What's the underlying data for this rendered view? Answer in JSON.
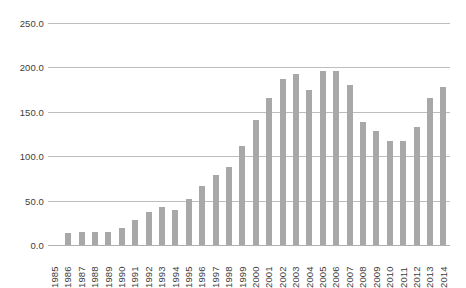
{
  "chart_data": {
    "type": "bar",
    "title": "",
    "subtitle": "",
    "xlabel": "",
    "ylabel": "",
    "ylim": [
      0,
      250
    ],
    "ytick_values": [
      250.0,
      200.0,
      150.0,
      100.0,
      50.0,
      0.0
    ],
    "ytick_labels": [
      "250.0",
      "200.0",
      "150.0",
      "100.0",
      "50.0",
      "0.0"
    ],
    "grid": true,
    "legend": "none",
    "bar_color": "#a8a8a8",
    "grid_color": "#bdbdbd",
    "axis_text_color": "#3d3d3d",
    "background": "#ffffff",
    "categories": [
      "1985",
      "1986",
      "1987",
      "1988",
      "1989",
      "1990",
      "1991",
      "1992",
      "1993",
      "1994",
      "1995",
      "1996",
      "1997",
      "1998",
      "1999",
      "2000",
      "2001",
      "2002",
      "2003",
      "2004",
      "2005",
      "2006",
      "2007",
      "2008",
      "2009",
      "2010",
      "2011",
      "2012",
      "2013",
      "2014"
    ],
    "values": [
      0,
      14,
      15,
      15,
      15,
      19,
      28,
      37,
      43,
      39,
      52,
      66,
      79,
      88,
      111,
      141,
      166,
      187,
      193,
      175,
      196,
      196,
      180,
      139,
      128,
      117,
      117,
      133,
      165,
      178
    ]
  }
}
